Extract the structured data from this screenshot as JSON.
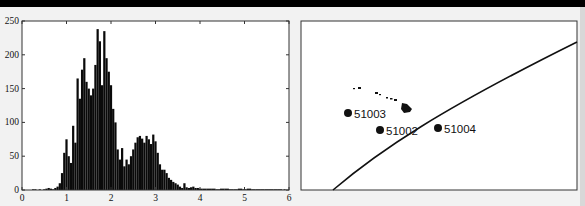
{
  "chart_data": [
    {
      "type": "bar",
      "title": "",
      "xlabel": "",
      "ylabel": "",
      "xlim": [
        0,
        6
      ],
      "ylim": [
        0,
        250
      ],
      "xticks": [
        "0",
        "1",
        "2",
        "3",
        "4",
        "5",
        "6"
      ],
      "yticks": [
        "0",
        "50",
        "100",
        "150",
        "200",
        "250"
      ],
      "grid": false,
      "legend": null,
      "bin_width": 0.05,
      "x": [
        0.25,
        0.3,
        0.35,
        0.4,
        0.45,
        0.5,
        0.55,
        0.6,
        0.65,
        0.7,
        0.75,
        0.8,
        0.85,
        0.9,
        0.95,
        1.0,
        1.05,
        1.1,
        1.15,
        1.2,
        1.25,
        1.3,
        1.35,
        1.4,
        1.45,
        1.5,
        1.55,
        1.6,
        1.65,
        1.7,
        1.75,
        1.8,
        1.85,
        1.9,
        1.95,
        2.0,
        2.05,
        2.1,
        2.15,
        2.2,
        2.25,
        2.3,
        2.35,
        2.4,
        2.45,
        2.5,
        2.55,
        2.6,
        2.65,
        2.7,
        2.75,
        2.8,
        2.85,
        2.9,
        2.95,
        3.0,
        3.05,
        3.1,
        3.15,
        3.2,
        3.25,
        3.3,
        3.35,
        3.4,
        3.45,
        3.5,
        3.55,
        3.6,
        3.65,
        3.7,
        3.75,
        3.8,
        3.85,
        3.9,
        3.95,
        4.0,
        4.1,
        4.2,
        4.3,
        4.4,
        4.5,
        4.6,
        4.7,
        4.8,
        4.9,
        5.0,
        5.1,
        5.2,
        5.3,
        5.4,
        5.5,
        5.6,
        5.7,
        5.8,
        5.9
      ],
      "values": [
        1,
        1,
        0,
        1,
        0,
        1,
        2,
        3,
        2,
        1,
        3,
        5,
        10,
        25,
        55,
        75,
        50,
        40,
        95,
        70,
        165,
        135,
        178,
        195,
        160,
        150,
        140,
        150,
        185,
        238,
        220,
        155,
        235,
        195,
        175,
        155,
        120,
        100,
        60,
        45,
        62,
        35,
        45,
        38,
        50,
        60,
        70,
        78,
        80,
        76,
        70,
        80,
        75,
        68,
        82,
        72,
        55,
        38,
        30,
        30,
        25,
        18,
        15,
        12,
        10,
        8,
        5,
        3,
        10,
        4,
        3,
        4,
        5,
        3,
        3,
        2,
        2,
        2,
        2,
        1,
        2,
        2,
        1,
        1,
        2,
        1,
        2,
        1,
        1,
        1,
        1,
        1,
        1,
        1,
        1
      ]
    },
    {
      "type": "map",
      "title": "",
      "markers": [
        {
          "label": "51003",
          "x": 348,
          "y": 113
        },
        {
          "label": "51002",
          "x": 380,
          "y": 130
        },
        {
          "label": "51004",
          "x": 438,
          "y": 128
        }
      ],
      "features": [
        "Hawaiian Islands outline",
        "diagonal track line"
      ]
    }
  ],
  "histogram": {
    "xticks": [
      "0",
      "1",
      "2",
      "3",
      "4",
      "5",
      "6"
    ],
    "yticks": [
      "0",
      "50",
      "100",
      "150",
      "200",
      "250"
    ]
  },
  "map": {
    "stations": [
      {
        "label": "51003"
      },
      {
        "label": "51002"
      },
      {
        "label": "51004"
      }
    ]
  },
  "colors": {
    "bars": "#0a0a0a",
    "frame": "#333333",
    "background": "#f2f2f2",
    "topbar": "#000000"
  }
}
